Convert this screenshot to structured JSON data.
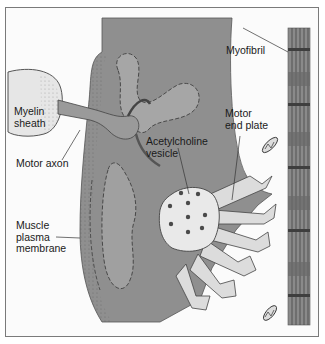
{
  "diagram": {
    "colors": {
      "background": "#fbfbfb",
      "frame_border": "#7a7a7a",
      "muscle_cell": "#8f8f8f",
      "axon": "#9a9a9a",
      "myelin": "#e6e6e6",
      "vesicle": "#e9e9e9",
      "vesicle_dots": "#4a4a4a",
      "end_plate_folds": "#dcdcdc",
      "myofibril": "#8a8a8a",
      "label_text": "#1a1a1a",
      "leader_line": "#333333"
    },
    "labels": {
      "myelin_sheath": "Myelin\nsheath",
      "motor_axon": "Motor axon",
      "acetylcholine_vesicle": "Acetylcholine\nvesicle",
      "motor_end_plate": "Motor\nend plate",
      "myofibril": "Myofibril",
      "muscle_plasma_membrane": "Muscle\nplasma\nmembrane"
    }
  }
}
